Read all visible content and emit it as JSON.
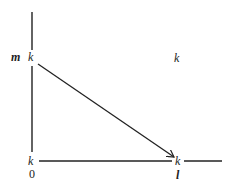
{
  "diagram": {
    "type": "directed graph on axes",
    "line_color": "#222222",
    "background": "#ffffff",
    "labels": {
      "y_axis_label": "m",
      "node_top_left": "k",
      "node_top_right": "k",
      "node_origin": "k",
      "origin_value": "0",
      "node_bottom_right": "k",
      "x_axis_label": "l"
    },
    "edges": [
      {
        "from": "node_top_left",
        "to": "node_bottom_right",
        "directed": true
      }
    ]
  }
}
